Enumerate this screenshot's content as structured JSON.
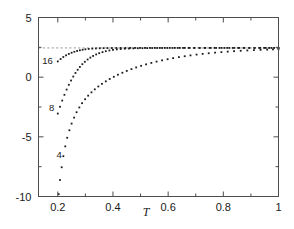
{
  "chart_data": {
    "type": "scatter",
    "title": "",
    "subtitle": "",
    "xlabel": "T",
    "ylabel": "",
    "xlim": [
      0.13,
      1.0
    ],
    "ylim": [
      -10,
      5
    ],
    "grid": false,
    "legend_position": "inline-curve-labels",
    "x_major_ticks": [
      0.2,
      0.4,
      0.6,
      0.8,
      1.0
    ],
    "x_major_tick_labels": [
      "0.2",
      "0.4",
      "0.6",
      "0.8",
      "1"
    ],
    "x_minor_ticks": [
      0.3,
      0.5,
      0.7,
      0.9
    ],
    "y_major_ticks": [
      5,
      0,
      -5,
      -10
    ],
    "y_major_tick_labels": [
      "5",
      "0",
      "-5",
      "-10"
    ],
    "y_minor_ticks": [
      2.5,
      -2.5,
      -7.5
    ],
    "annotations": [
      {
        "text": "16",
        "x": 0.205,
        "y": 1.35,
        "label_x": 0.163,
        "label_y": 1.4
      },
      {
        "text": "8",
        "x": 0.205,
        "y": -3.05,
        "label_x": 0.178,
        "label_y": -2.5
      },
      {
        "text": "4",
        "x": 0.205,
        "y": -9.8,
        "label_x": 0.205,
        "label_y": -6.45
      }
    ],
    "asymptote": {
      "y": 2.45,
      "style": "dashed",
      "color": "#9a9a9a",
      "x_from": 0.13,
      "x_to": 1.0
    },
    "series": [
      {
        "name": "16",
        "marker": "square-dot",
        "color": "#1c1c1c",
        "points": [
          [
            0.2,
            1.32
          ],
          [
            0.21,
            1.52
          ],
          [
            0.22,
            1.69
          ],
          [
            0.23,
            1.83
          ],
          [
            0.24,
            1.948
          ],
          [
            0.25,
            2.046
          ],
          [
            0.26,
            2.128
          ],
          [
            0.27,
            2.196
          ],
          [
            0.28,
            2.252
          ],
          [
            0.29,
            2.298
          ],
          [
            0.3,
            2.336
          ],
          [
            0.312,
            2.368
          ],
          [
            0.325,
            2.392
          ],
          [
            0.338,
            2.41
          ],
          [
            0.352,
            2.424
          ],
          [
            0.366,
            2.432
          ],
          [
            0.38,
            2.438
          ],
          [
            0.396,
            2.442
          ],
          [
            0.412,
            2.446
          ],
          [
            0.428,
            2.448
          ],
          [
            0.445,
            2.45
          ],
          [
            0.462,
            2.451
          ],
          [
            0.48,
            2.452
          ],
          [
            0.498,
            2.452
          ],
          [
            0.516,
            2.452
          ],
          [
            0.534,
            2.452
          ],
          [
            0.552,
            2.452
          ],
          [
            0.57,
            2.452
          ],
          [
            0.588,
            2.452
          ],
          [
            0.606,
            2.452
          ],
          [
            0.624,
            2.452
          ],
          [
            0.642,
            2.452
          ],
          [
            0.66,
            2.452
          ],
          [
            0.678,
            2.452
          ],
          [
            0.696,
            2.452
          ],
          [
            0.714,
            2.452
          ],
          [
            0.732,
            2.452
          ],
          [
            0.75,
            2.452
          ],
          [
            0.768,
            2.452
          ],
          [
            0.786,
            2.452
          ],
          [
            0.804,
            2.452
          ],
          [
            0.822,
            2.452
          ],
          [
            0.84,
            2.452
          ],
          [
            0.858,
            2.452
          ],
          [
            0.876,
            2.452
          ],
          [
            0.894,
            2.452
          ],
          [
            0.912,
            2.452
          ],
          [
            0.93,
            2.452
          ],
          [
            0.948,
            2.452
          ],
          [
            0.966,
            2.452
          ],
          [
            0.984,
            2.452
          ],
          [
            1.0,
            2.452
          ]
        ]
      },
      {
        "name": "8",
        "marker": "square-dot",
        "color": "#1c1c1c",
        "points": [
          [
            0.2,
            -3.05
          ],
          [
            0.208,
            -2.48
          ],
          [
            0.216,
            -1.96
          ],
          [
            0.224,
            -1.48
          ],
          [
            0.232,
            -1.04
          ],
          [
            0.24,
            -0.64
          ],
          [
            0.248,
            -0.28
          ],
          [
            0.256,
            0.05
          ],
          [
            0.264,
            0.35
          ],
          [
            0.272,
            0.62
          ],
          [
            0.28,
            0.86
          ],
          [
            0.289,
            1.09
          ],
          [
            0.298,
            1.29
          ],
          [
            0.308,
            1.48
          ],
          [
            0.318,
            1.64
          ],
          [
            0.328,
            1.78
          ],
          [
            0.339,
            1.905
          ],
          [
            0.35,
            2.01
          ],
          [
            0.362,
            2.1
          ],
          [
            0.374,
            2.175
          ],
          [
            0.387,
            2.238
          ],
          [
            0.4,
            2.288
          ],
          [
            0.414,
            2.328
          ],
          [
            0.428,
            2.358
          ],
          [
            0.443,
            2.382
          ],
          [
            0.458,
            2.4
          ],
          [
            0.474,
            2.414
          ],
          [
            0.49,
            2.424
          ],
          [
            0.507,
            2.431
          ],
          [
            0.524,
            2.437
          ],
          [
            0.542,
            2.441
          ],
          [
            0.56,
            2.444
          ],
          [
            0.578,
            2.446
          ],
          [
            0.597,
            2.448
          ],
          [
            0.616,
            2.449
          ],
          [
            0.635,
            2.45
          ],
          [
            0.654,
            2.451
          ],
          [
            0.674,
            2.451
          ],
          [
            0.694,
            2.452
          ],
          [
            0.714,
            2.452
          ],
          [
            0.734,
            2.452
          ],
          [
            0.754,
            2.452
          ],
          [
            0.774,
            2.452
          ],
          [
            0.794,
            2.452
          ],
          [
            0.814,
            2.452
          ],
          [
            0.834,
            2.452
          ],
          [
            0.854,
            2.452
          ],
          [
            0.874,
            2.452
          ],
          [
            0.894,
            2.452
          ],
          [
            0.914,
            2.452
          ],
          [
            0.934,
            2.452
          ],
          [
            0.954,
            2.452
          ],
          [
            0.974,
            2.452
          ],
          [
            1.0,
            2.452
          ]
        ]
      },
      {
        "name": "4",
        "marker": "square-dot",
        "color": "#1c1c1c",
        "points": [
          [
            0.203,
            -9.8
          ],
          [
            0.208,
            -8.62
          ],
          [
            0.214,
            -7.55
          ],
          [
            0.22,
            -6.62
          ],
          [
            0.227,
            -5.8
          ],
          [
            0.234,
            -5.08
          ],
          [
            0.242,
            -4.45
          ],
          [
            0.25,
            -3.89
          ],
          [
            0.259,
            -3.39
          ],
          [
            0.268,
            -2.94
          ],
          [
            0.278,
            -2.54
          ],
          [
            0.288,
            -2.18
          ],
          [
            0.299,
            -1.85
          ],
          [
            0.31,
            -1.55
          ],
          [
            0.322,
            -1.27
          ],
          [
            0.334,
            -1.02
          ],
          [
            0.347,
            -0.78
          ],
          [
            0.36,
            -0.56
          ],
          [
            0.374,
            -0.35
          ],
          [
            0.388,
            -0.155
          ],
          [
            0.403,
            0.03
          ],
          [
            0.418,
            0.205
          ],
          [
            0.434,
            0.37
          ],
          [
            0.45,
            0.525
          ],
          [
            0.467,
            0.675
          ],
          [
            0.484,
            0.815
          ],
          [
            0.502,
            0.95
          ],
          [
            0.52,
            1.075
          ],
          [
            0.539,
            1.195
          ],
          [
            0.558,
            1.305
          ],
          [
            0.578,
            1.41
          ],
          [
            0.598,
            1.505
          ],
          [
            0.618,
            1.595
          ],
          [
            0.639,
            1.68
          ],
          [
            0.66,
            1.755
          ],
          [
            0.681,
            1.825
          ],
          [
            0.703,
            1.892
          ],
          [
            0.725,
            1.95
          ],
          [
            0.747,
            2.005
          ],
          [
            0.77,
            2.055
          ],
          [
            0.793,
            2.1
          ],
          [
            0.816,
            2.14
          ],
          [
            0.839,
            2.178
          ],
          [
            0.863,
            2.21
          ],
          [
            0.887,
            2.24
          ],
          [
            0.911,
            2.266
          ],
          [
            0.935,
            2.29
          ],
          [
            0.959,
            2.31
          ],
          [
            0.98,
            2.326
          ],
          [
            1.0,
            2.34
          ]
        ]
      }
    ]
  },
  "axes": {
    "x_label": "T",
    "x_tick_labels": [
      "0.2",
      "0.4",
      "0.6",
      "0.8",
      "1"
    ],
    "y_tick_labels": [
      "5",
      "0",
      "-5",
      "-10"
    ]
  },
  "colors": {
    "marker": "#1c1c1c",
    "frame": "#4d4d4d",
    "asymptote": "#9a9a9a",
    "text": "#1a1a1a",
    "background": "#ffffff"
  }
}
